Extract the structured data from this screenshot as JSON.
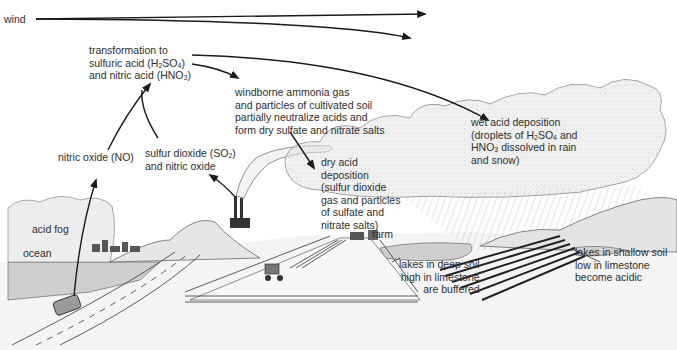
{
  "labels": {
    "wind": "wind",
    "transformation": [
      "transformation to",
      "sulfuric acid (H",
      "2",
      "SO",
      "4",
      ")",
      "and nitric acid (HNO",
      "3",
      ")"
    ],
    "ammonia": [
      "windborne ammonia gas",
      "and particles of cultivated soil",
      "partially neutralize acids and",
      "form dry sulfate and nitrate salts"
    ],
    "wet_deposition": [
      "wet acid deposition",
      "(droplets of H",
      "2",
      "SO",
      "4",
      " and",
      "HNO",
      "3",
      " dissolved in rain",
      "and snow)"
    ],
    "nitric_oxide": "nitric oxide (NO)",
    "sulfur_dioxide": [
      "sulfur dioxide (SO",
      "2",
      ")",
      "and nitric oxide"
    ],
    "dry_deposition": [
      "dry acid",
      "deposition",
      "(sulfur dioxide",
      "gas and particles",
      "of sulfate and",
      "nitrate salts)"
    ],
    "acid_fog": "acid fog",
    "ocean": "ocean",
    "farm": "farm",
    "lakes_deep": [
      "lakes in deep soil",
      "high in limestone",
      "are buffered"
    ],
    "lakes_shallow": [
      "lakes in shallow soil",
      "low in limestone",
      "become acidic"
    ]
  },
  "colors": {
    "ink": "#1a1a1a",
    "text": "#2e2e2e",
    "cloud_shade": "#d9d9d9",
    "water": "#cfcfcf",
    "ground": "#f2f2f2"
  }
}
